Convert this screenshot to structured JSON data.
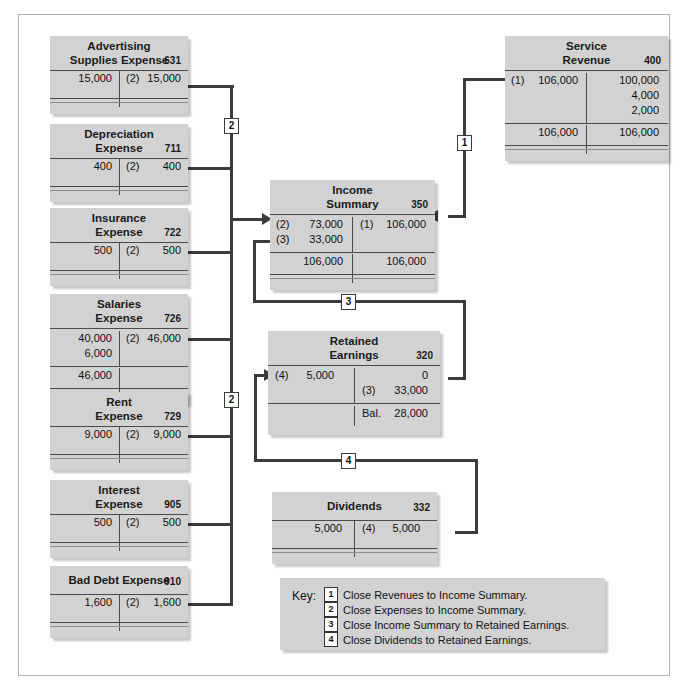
{
  "accounts": [
    {
      "id": "advertising-supplies-expense",
      "title1": "Advertising",
      "title2": "Supplies Expense",
      "number": "631",
      "debits": [
        {
          "ref": "",
          "amt": "15,000"
        }
      ],
      "credits": [
        {
          "ref": "(2)",
          "amt": "15,000"
        }
      ],
      "debit_total": "",
      "credit_total": ""
    },
    {
      "id": "depreciation-expense",
      "title1": "Depreciation",
      "title2": "Expense",
      "number": "711",
      "debits": [
        {
          "ref": "",
          "amt": "400"
        }
      ],
      "credits": [
        {
          "ref": "(2)",
          "amt": "400"
        }
      ],
      "debit_total": "",
      "credit_total": ""
    },
    {
      "id": "insurance-expense",
      "title1": "Insurance",
      "title2": "Expense",
      "number": "722",
      "debits": [
        {
          "ref": "",
          "amt": "500"
        }
      ],
      "credits": [
        {
          "ref": "(2)",
          "amt": "500"
        }
      ],
      "debit_total": "",
      "credit_total": ""
    },
    {
      "id": "salaries-expense",
      "title1": "Salaries",
      "title2": "Expense",
      "number": "726",
      "debits": [
        {
          "ref": "",
          "amt": "40,000"
        },
        {
          "ref": "",
          "amt": "6,000"
        }
      ],
      "credits": [
        {
          "ref": "(2)",
          "amt": "46,000"
        }
      ],
      "debit_total": "46,000",
      "credit_total": ""
    },
    {
      "id": "rent-expense",
      "title1": "Rent",
      "title2": "Expense",
      "number": "729",
      "debits": [
        {
          "ref": "",
          "amt": "9,000"
        }
      ],
      "credits": [
        {
          "ref": "(2)",
          "amt": "9,000"
        }
      ],
      "debit_total": "",
      "credit_total": ""
    },
    {
      "id": "interest-expense",
      "title1": "Interest",
      "title2": "Expense",
      "number": "905",
      "debits": [
        {
          "ref": "",
          "amt": "500"
        }
      ],
      "credits": [
        {
          "ref": "(2)",
          "amt": "500"
        }
      ],
      "debit_total": "",
      "credit_total": ""
    },
    {
      "id": "bad-debt-expense",
      "title1": "Bad Debt Expense",
      "title2": "",
      "number": "910",
      "debits": [
        {
          "ref": "",
          "amt": "1,600"
        }
      ],
      "credits": [
        {
          "ref": "(2)",
          "amt": "1,600"
        }
      ],
      "debit_total": "",
      "credit_total": ""
    },
    {
      "id": "service-revenue",
      "title1": "Service",
      "title2": "Revenue",
      "number": "400",
      "debits": [
        {
          "ref": "(1)",
          "amt": "106,000"
        }
      ],
      "credits": [
        {
          "ref": "",
          "amt": "100,000"
        },
        {
          "ref": "",
          "amt": "4,000"
        },
        {
          "ref": "",
          "amt": "2,000"
        }
      ],
      "debit_total": "106,000",
      "credit_total": "106,000"
    },
    {
      "id": "income-summary",
      "title1": "Income",
      "title2": "Summary",
      "number": "350",
      "debits": [
        {
          "ref": "(2)",
          "amt": "73,000"
        },
        {
          "ref": "(3)",
          "amt": "33,000"
        }
      ],
      "credits": [
        {
          "ref": "(1)",
          "amt": "106,000"
        }
      ],
      "debit_total": "106,000",
      "credit_total": "106,000"
    },
    {
      "id": "retained-earnings",
      "title1": "Retained",
      "title2": "Earnings",
      "number": "320",
      "debits": [
        {
          "ref": "(4)",
          "amt": "5,000"
        }
      ],
      "credits": [
        {
          "ref": "",
          "amt": "0"
        },
        {
          "ref": "(3)",
          "amt": "33,000"
        }
      ],
      "debit_total": "",
      "credit_total": "28,000",
      "credit_total_label": "Bal."
    },
    {
      "id": "dividends",
      "title1": "Dividends",
      "title2": "",
      "number": "332",
      "debits": [
        {
          "ref": "",
          "amt": "5,000"
        }
      ],
      "credits": [
        {
          "ref": "(4)",
          "amt": "5,000"
        }
      ],
      "debit_total": "",
      "credit_total": ""
    }
  ],
  "badges": {
    "one": "1",
    "two": "2",
    "three": "3",
    "four": "4"
  },
  "key": {
    "label": "Key:",
    "items": [
      {
        "num": "1",
        "text": "Close Revenues to Income Summary."
      },
      {
        "num": "2",
        "text": "Close Expenses to Income Summary."
      },
      {
        "num": "3",
        "text": "Close Income Summary to Retained Earnings."
      },
      {
        "num": "4",
        "text": "Close Dividends to Retained Earnings."
      }
    ]
  },
  "colors": {
    "box": "#d2d2d2",
    "line": "#3b3b3b",
    "rule": "#4a4a4a",
    "frame": "#b4b4b4"
  }
}
